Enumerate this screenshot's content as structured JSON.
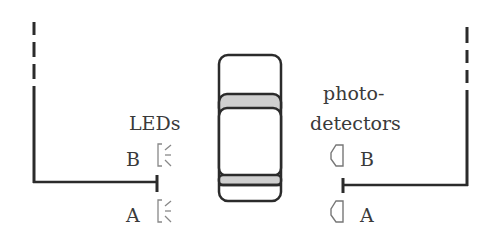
{
  "labels": {
    "leds": "LEDs",
    "photodetectors_line1": "photo-",
    "photodetectors_line2": "detectors",
    "led_b": "B",
    "led_a": "A",
    "detector_b": "B",
    "detector_a": "A"
  },
  "colors": {
    "line": "#2b2b2b",
    "text": "#3a3a3a",
    "shade": "#c8c8c8",
    "icon": "#777777"
  }
}
